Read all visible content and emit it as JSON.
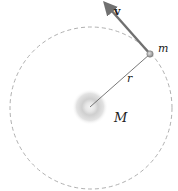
{
  "diagram": {
    "labels": {
      "velocity": "v",
      "small_mass": "m",
      "radius": "r",
      "central_mass": "M"
    },
    "colors": {
      "orbit": "#b0b0b0",
      "arrow": "#707070",
      "radius_line": "#555555",
      "central_glow": "#c8c8c8",
      "satellite": "#a0a0a0"
    }
  }
}
